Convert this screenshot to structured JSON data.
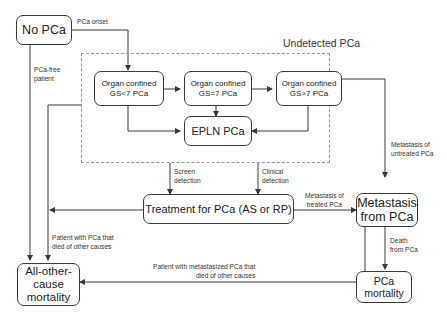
{
  "group": {
    "title": "Undetected PCa"
  },
  "nodes": {
    "no_pca": "No PCa",
    "gs_lt7": [
      "Organ confined",
      "GS<7 PCa"
    ],
    "gs_eq7": [
      "Organ confined",
      "GS=7 PCa"
    ],
    "gs_gt7": [
      "Organ confined",
      "GS>7 PCa"
    ],
    "epln": "EPLN PCa",
    "treatment": "Treatment for PCa (AS or RP)",
    "metastasis": [
      "Metastasis",
      "from PCa"
    ],
    "all_other": [
      "All-other-",
      "cause",
      "mortality"
    ],
    "pca_mortality": [
      "PCa",
      "mortality"
    ]
  },
  "edges": {
    "pca_onset": "PCa onset",
    "pca_free": [
      "PCa-free",
      "patient"
    ],
    "screen_detection": [
      "Screen",
      "detection"
    ],
    "clinical_detection": [
      "Clinical",
      "detection"
    ],
    "metastasis_untreated": [
      "Metastasis of",
      "untreated PCa"
    ],
    "metastasis_treated": [
      "Metastasis of",
      "treated PCa"
    ],
    "died_other_treated": [
      "Patient with PCa that",
      "died of other causes"
    ],
    "died_other_metastasized": [
      "Patient with metastasized PCa that",
      "died of other causes"
    ],
    "death_from_pca": [
      "Death",
      "from PCa"
    ]
  },
  "colors": {
    "line": "#3a3a3a",
    "dashed": "#999999",
    "text": "#222222"
  }
}
